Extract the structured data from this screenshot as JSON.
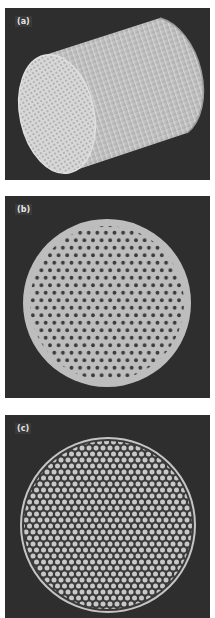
{
  "figure": {
    "panels": [
      {
        "label": "(a)",
        "description": "3D cylinder with honeycomb channels on end face"
      },
      {
        "label": "(b)",
        "description": "Circular cross-section with hexagonal array of dark holes"
      },
      {
        "label": "(c)",
        "description": "Circular cross-section with dense hexagonal lattice of light channels inside ring"
      }
    ]
  },
  "colors": {
    "background": "#2e2e2e",
    "solid": "#bdbdbd",
    "hole": "#3a3a3a",
    "light_channel": "#c8c8c8"
  }
}
